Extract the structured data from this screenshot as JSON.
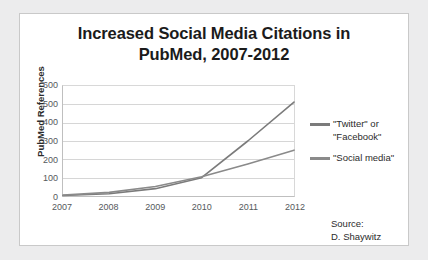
{
  "card": {
    "title_line_1": "Increased Social Media Citations in",
    "title_line_2": "PubMed, 2007-2012"
  },
  "axes": {
    "y_title": "PubMed References",
    "y_ticks": [
      "600",
      "500",
      "400",
      "300",
      "200",
      "100",
      "0"
    ],
    "x_ticks": [
      "2007",
      "2008",
      "2009",
      "2010",
      "2011",
      "2012"
    ]
  },
  "legend": {
    "entries": [
      {
        "label_line_1": "\"Twitter\" or",
        "label_line_2": "\"Facebook\"",
        "color": "#7b7b7b"
      },
      {
        "label_line_1": "\"Social media\"",
        "label_line_2": "",
        "color": "#8a8a8a"
      }
    ]
  },
  "source": {
    "line_1": "Source:",
    "line_2": "D. Shaywitz"
  },
  "chart_data": {
    "type": "line",
    "title": "Increased Social Media Citations in PubMed, 2007-2012",
    "xlabel": "",
    "ylabel": "PubMed References",
    "x": [
      2007,
      2008,
      2009,
      2010,
      2011,
      2012
    ],
    "xlim": [
      2007,
      2012
    ],
    "ylim": [
      0,
      600
    ],
    "ytick_step": 100,
    "grid": true,
    "legend_position": "right",
    "annotations": [
      "Source: D. Shaywitz"
    ],
    "series": [
      {
        "name": "\"Twitter\" or \"Facebook\"",
        "color": "#7b7b7b",
        "values": [
          3,
          12,
          40,
          100,
          300,
          512
        ]
      },
      {
        "name": "\"Social media\"",
        "color": "#8a8a8a",
        "values": [
          5,
          20,
          52,
          105,
          175,
          250
        ]
      }
    ]
  }
}
